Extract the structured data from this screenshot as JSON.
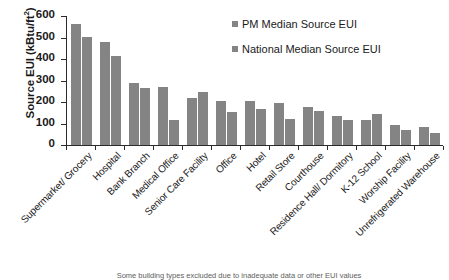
{
  "chart_data": {
    "type": "bar",
    "title": "",
    "xlabel": "",
    "ylabel": "Source EUI (kBtu/ft²)",
    "ylim": [
      0,
      600
    ],
    "ytick_step": 100,
    "grid": false,
    "legend_position": "top-right",
    "categories": [
      "Supermarket/ Grocery",
      "Hospital",
      "Bank Branch",
      "Medical Office",
      "Senior Care Facility",
      "Office",
      "Hotel",
      "Retail Store",
      "Courthouse",
      "Residence Hall/ Dormitory",
      "K-12 School",
      "Worship Facility",
      "Unrefrigerated Warehouse"
    ],
    "series": [
      {
        "name": "PM Median Source EUI",
        "color": "#848484",
        "values": [
          563,
          480,
          290,
          268,
          218,
          205,
          205,
          196,
          178,
          134,
          118,
          94,
          85
        ]
      },
      {
        "name": "National Median Source EUI",
        "color": "#848484",
        "values": [
          503,
          412,
          265,
          118,
          245,
          152,
          168,
          119,
          157,
          117,
          142,
          70,
          54
        ]
      }
    ],
    "ytick_labels": [
      "0",
      "100",
      "200",
      "300",
      "400",
      "500",
      "600"
    ]
  },
  "axis": {
    "y_title": "Source EUI (kBtu/ft",
    "y_title_sup": "2",
    "y_title_close": ")"
  },
  "legend": {
    "items": [
      {
        "label": "PM Median Source EUI"
      },
      {
        "label": "National Median Source EUI"
      }
    ]
  },
  "caption": {
    "text": "Some building types excluded due to inadequate data or other EUI values"
  }
}
